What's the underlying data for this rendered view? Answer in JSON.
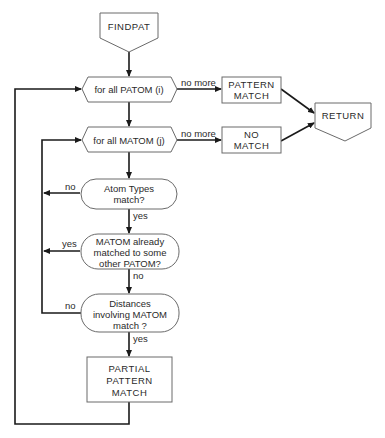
{
  "diagram": {
    "type": "flowchart",
    "nodes": {
      "findpat": {
        "label": "FINDPAT",
        "shape": "offpage-connector"
      },
      "patom_loop": {
        "label": "for all PATOM (i)",
        "shape": "hexagon"
      },
      "matom_loop": {
        "label": "for all MATOM (j)",
        "shape": "hexagon"
      },
      "pattern_match": {
        "lines": [
          "PATTERN",
          "MATCH"
        ],
        "shape": "rectangle"
      },
      "no_match": {
        "lines": [
          "NO",
          "MATCH"
        ],
        "shape": "rectangle"
      },
      "return": {
        "label": "RETURN",
        "shape": "offpage-connector"
      },
      "atom_types": {
        "lines": [
          "Atom Types",
          "match?"
        ],
        "shape": "rounded-decision"
      },
      "matom_already": {
        "lines": [
          "MATOM already",
          "matched to some",
          "other PATOM?"
        ],
        "shape": "rounded-decision"
      },
      "distances": {
        "lines": [
          "Distances",
          "involving MATOM",
          "match ?"
        ],
        "shape": "rounded-decision"
      },
      "partial_match": {
        "lines": [
          "PARTIAL",
          "PATTERN",
          "MATCH"
        ],
        "shape": "rectangle"
      }
    },
    "edge_labels": {
      "patom_no_more": "no more",
      "matom_no_more": "no more",
      "atom_types_no": "no",
      "atom_types_yes": "yes",
      "matom_already_yes": "yes",
      "matom_already_no": "no",
      "distances_no": "no",
      "distances_yes": "yes"
    },
    "edges": [
      {
        "from": "FINDPAT",
        "to": "for all PATOM (i)"
      },
      {
        "from": "for all PATOM (i)",
        "to": "PATTERN MATCH",
        "label": "no more"
      },
      {
        "from": "for all PATOM (i)",
        "to": "for all MATOM (j)"
      },
      {
        "from": "for all MATOM (j)",
        "to": "NO MATCH",
        "label": "no more"
      },
      {
        "from": "PATTERN MATCH",
        "to": "RETURN"
      },
      {
        "from": "NO MATCH",
        "to": "RETURN"
      },
      {
        "from": "for all MATOM (j)",
        "to": "Atom Types match?"
      },
      {
        "from": "Atom Types match?",
        "to": "for all MATOM (j)",
        "label": "no"
      },
      {
        "from": "Atom Types match?",
        "to": "MATOM already matched to some other PATOM?",
        "label": "yes"
      },
      {
        "from": "MATOM already matched to some other PATOM?",
        "to": "for all MATOM (j)",
        "label": "yes"
      },
      {
        "from": "MATOM already matched to some other PATOM?",
        "to": "Distances involving MATOM match?",
        "label": "no"
      },
      {
        "from": "Distances involving MATOM match?",
        "to": "for all MATOM (j)",
        "label": "no"
      },
      {
        "from": "Distances involving MATOM match?",
        "to": "PARTIAL PATTERN MATCH",
        "label": "yes"
      },
      {
        "from": "PARTIAL PATTERN MATCH",
        "to": "for all PATOM (i)"
      }
    ]
  }
}
